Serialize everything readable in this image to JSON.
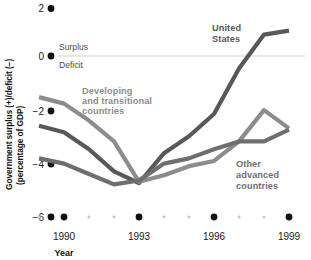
{
  "chart_data": {
    "type": "line",
    "title": "",
    "xlabel": "Year",
    "ylabel": "Government surplus (+)/deficit (−) (percentage of GDP)",
    "ylabel_line1": "Government surplus (+)/deficit (−)",
    "ylabel_line2": "(percentage of GDP)",
    "ylim": [
      -6,
      2
    ],
    "xlim": [
      1989,
      1999
    ],
    "yticks": [
      2,
      0,
      -2,
      -4,
      -6
    ],
    "ytick_labels": [
      "2",
      "0",
      "−2",
      "−4",
      "−6"
    ],
    "xticks": [
      1989,
      1990,
      1991,
      1992,
      1993,
      1994,
      1995,
      1996,
      1997,
      1998,
      1999
    ],
    "xtick_labels_major": [
      "1990",
      "1993",
      "1996",
      "1999"
    ],
    "xticks_major": [
      1990,
      1993,
      1996,
      1999
    ],
    "grid": false,
    "zero_line": 0,
    "annotations": [
      {
        "text": "Surplus",
        "x": 1989.6,
        "y": 0.55
      },
      {
        "text": "Deficit",
        "x": 1989.6,
        "y": -0.55
      }
    ],
    "x": [
      1989,
      1990,
      1991,
      1992,
      1993,
      1994,
      1995,
      1996,
      1997,
      1998,
      1999
    ],
    "series": [
      {
        "name": "United States",
        "color": "#58585a",
        "label_x": 1995.4,
        "label_y": 1.35,
        "values": [
          -2.5,
          -2.75,
          -3.4,
          -4.25,
          -4.7,
          -3.55,
          -2.9,
          -2.05,
          -0.3,
          1.0,
          1.15
        ]
      },
      {
        "name": "Developing and transitional countries",
        "color": "#8c8c8e",
        "label_x": 1990.6,
        "label_y": -1.25,
        "values": [
          -1.4,
          -1.65,
          -2.3,
          -3.1,
          -4.65,
          -4.4,
          -4.05,
          -3.85,
          -3.1,
          -1.9,
          -2.6
        ]
      },
      {
        "name": "Other advanced countries",
        "color": "#6e6e70",
        "label_x": 1996.2,
        "label_y": -4.1,
        "values": [
          -3.75,
          -3.95,
          -4.35,
          -4.75,
          -4.6,
          -3.95,
          -3.75,
          -3.4,
          -3.1,
          -3.1,
          -2.65
        ]
      }
    ],
    "series_label_lines": {
      "united_states": [
        "United",
        "States"
      ],
      "developing": [
        "Developing",
        "and transitional",
        "countries"
      ],
      "other_advanced": [
        "Other",
        "advanced",
        "countries"
      ]
    }
  },
  "colors": {
    "us_line": "#58585a",
    "developing_line": "#8c8c8e",
    "other_advanced_line": "#6e6e70",
    "tick_dot": "#101010",
    "tick_dot_minor": "#c9c9c9",
    "zero_line": "#cfcfcf",
    "text": "#111111",
    "label_text": "#4c4c4c",
    "background": "#ffffff"
  }
}
